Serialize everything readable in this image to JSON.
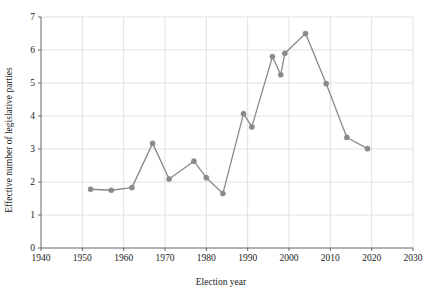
{
  "chart_data": {
    "type": "line",
    "title": "",
    "xlabel": "Election year",
    "ylabel": "Effective number of legislative parties",
    "xlim": [
      1940,
      2030
    ],
    "ylim": [
      0,
      7
    ],
    "xticks": [
      1940,
      1950,
      1960,
      1970,
      1980,
      1990,
      2000,
      2010,
      2020,
      2030
    ],
    "yticks": [
      0,
      1,
      2,
      3,
      4,
      5,
      6,
      7
    ],
    "grid": true,
    "legend": "none",
    "marker": "circle",
    "series": [
      {
        "name": "Effective number of legislative parties",
        "color": "#8a8a8a",
        "x": [
          1952,
          1957,
          1962,
          1967,
          1971,
          1977,
          1980,
          1984,
          1989,
          1991,
          1996,
          1998,
          1999,
          2004,
          2009,
          2014,
          2019
        ],
        "values": [
          1.78,
          1.75,
          1.83,
          3.17,
          2.09,
          2.63,
          2.13,
          1.65,
          4.07,
          3.67,
          5.8,
          5.25,
          5.9,
          6.5,
          4.98,
          3.35,
          3.01
        ]
      }
    ]
  },
  "axes": {
    "x_label": "Election year",
    "y_label": "Effective number of legislative parties",
    "x_tick_labels": [
      "1940",
      "1950",
      "1960",
      "1970",
      "1980",
      "1990",
      "2000",
      "2010",
      "2020",
      "2030"
    ],
    "y_tick_labels": [
      "0",
      "1",
      "2",
      "3",
      "4",
      "5",
      "6",
      "7"
    ]
  },
  "colors": {
    "line": "#8a8a8a",
    "marker": "#8a8a8a",
    "grid": "#d9d9d9",
    "axis": "#555555",
    "text": "#1a1a1a",
    "background": "#ffffff"
  }
}
